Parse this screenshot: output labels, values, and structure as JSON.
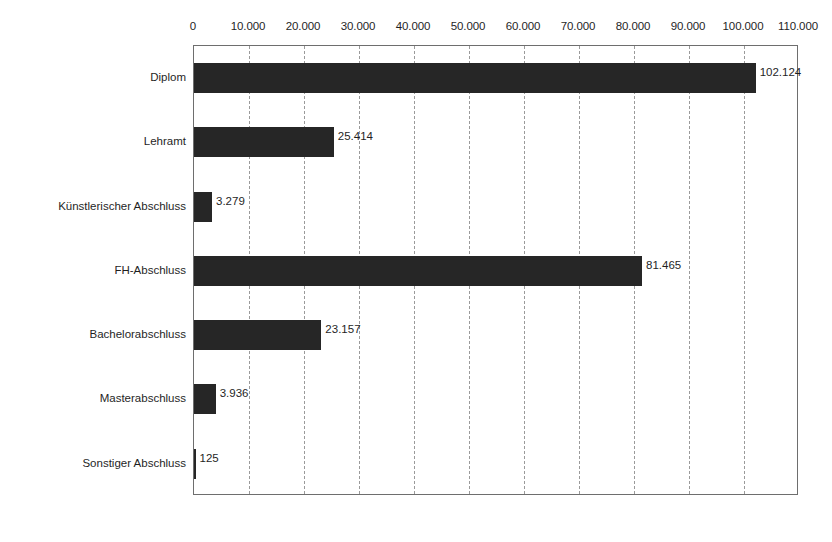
{
  "chart_data": {
    "type": "bar",
    "orientation": "horizontal",
    "title": "",
    "subtitle": "",
    "xlabel": "",
    "ylabel": "",
    "xlim": [
      0,
      110000
    ],
    "grid": true,
    "legend": false,
    "legend_position": "none",
    "bar_color": "#262626",
    "categories": [
      "Diplom",
      "Lehramt",
      "Künstlerischer Abschluss",
      "FH-Abschluss",
      "Bachelorabschluss",
      "Masterabschluss",
      "Sonstiger Abschluss"
    ],
    "values": [
      102124,
      25414,
      3279,
      81465,
      23157,
      3936,
      125
    ],
    "value_labels": [
      "102.124",
      "25.414",
      "3.279",
      "81.465",
      "23.157",
      "3.936",
      "125"
    ],
    "xticks": [
      0,
      10000,
      20000,
      30000,
      40000,
      50000,
      60000,
      70000,
      80000,
      90000,
      100000,
      110000
    ],
    "xtick_labels": [
      "0",
      "10.000",
      "20.000",
      "30.000",
      "40.000",
      "50.000",
      "60.000",
      "70.000",
      "80.000",
      "90.000",
      "100.000",
      "110.000"
    ]
  }
}
